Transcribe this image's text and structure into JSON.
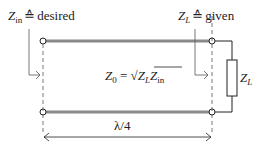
{
  "labels": {
    "zin_left": {
      "symbol": "Z",
      "sub": "in",
      "relation": "≙",
      "word": "desired"
    },
    "zl_right": {
      "symbol": "Z",
      "sub": "L",
      "relation": "≙",
      "word": "given"
    },
    "z0_formula": {
      "lhs": "Z",
      "lhs_sub": "0",
      "eq": " = ",
      "sqrt": "√",
      "a": "Z",
      "a_sub": "L",
      "b": "Z",
      "b_sub": "in"
    },
    "load": {
      "symbol": "Z",
      "sub": "L"
    },
    "length": "λ/4"
  },
  "colors": {
    "line": "#8a8a8a",
    "stroke": "#222222",
    "terminal_fill": "#ffffff"
  }
}
